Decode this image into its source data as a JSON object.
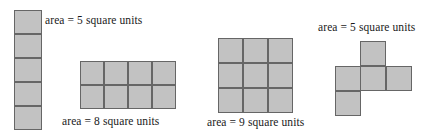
{
  "figure": {
    "background_color": "#ffffff",
    "cell_fill_color": "#c2c2c2",
    "cell_stroke_color": "#666666",
    "text_color": "#1a1a1a"
  },
  "shapes": [
    {
      "name": "vertical-column-pentomino",
      "label": "area = 5 square units",
      "area": 5,
      "unit": "square units",
      "rows": 5,
      "columns": 1,
      "cells": [
        [
          0,
          0
        ],
        [
          1,
          0
        ],
        [
          2,
          0
        ],
        [
          3,
          0
        ],
        [
          4,
          0
        ]
      ],
      "label_position": "right"
    },
    {
      "name": "rectangle-4x2",
      "label": "area = 8 square units",
      "area": 8,
      "unit": "square units",
      "rows": 2,
      "columns": 4,
      "cells": [
        [
          0,
          0
        ],
        [
          0,
          1
        ],
        [
          0,
          2
        ],
        [
          0,
          3
        ],
        [
          1,
          0
        ],
        [
          1,
          1
        ],
        [
          1,
          2
        ],
        [
          1,
          3
        ]
      ],
      "label_position": "below"
    },
    {
      "name": "square-3x3",
      "label": "area = 9 square units",
      "area": 9,
      "unit": "square units",
      "rows": 3,
      "columns": 3,
      "cells": [
        [
          0,
          0
        ],
        [
          0,
          1
        ],
        [
          0,
          2
        ],
        [
          1,
          0
        ],
        [
          1,
          1
        ],
        [
          1,
          2
        ],
        [
          2,
          0
        ],
        [
          2,
          1
        ],
        [
          2,
          2
        ]
      ],
      "label_position": "below"
    },
    {
      "name": "cross-pentomino",
      "label": "area = 5 square units",
      "area": 5,
      "unit": "square units",
      "rows": 3,
      "columns": 3,
      "cells": [
        [
          0,
          1
        ],
        [
          1,
          0
        ],
        [
          1,
          1
        ],
        [
          1,
          2
        ],
        [
          2,
          0
        ]
      ],
      "label_position": "above"
    }
  ]
}
